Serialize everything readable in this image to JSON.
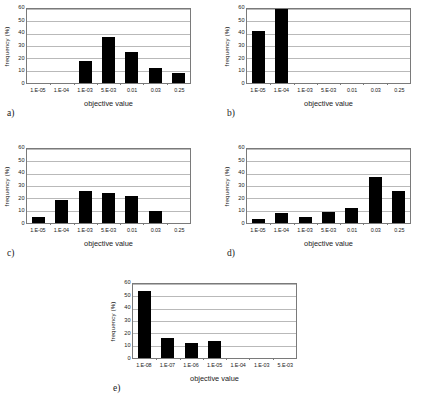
{
  "figure": {
    "background": "#ffffff",
    "bar_color": "#000000",
    "grid_color": "#b9b9b9",
    "axis_color": "#7a7a7a",
    "panel_count": 5
  },
  "common": {
    "ylabel": "frequency (%)",
    "xlabel": "objective value",
    "yticks": [
      "0",
      "10",
      "20",
      "30",
      "40",
      "50",
      "60"
    ],
    "ylim": [
      0,
      60
    ]
  },
  "panels": [
    {
      "letter": "a)",
      "key": "a"
    },
    {
      "letter": "b)",
      "key": "b"
    },
    {
      "letter": "c)",
      "key": "c"
    },
    {
      "letter": "d)",
      "key": "d"
    },
    {
      "letter": "e)",
      "key": "e"
    }
  ],
  "chart_data": [
    {
      "id": "a",
      "type": "bar",
      "title": "a)",
      "xlabel": "objective value",
      "ylabel": "frequency (%)",
      "categories": [
        "1.E-05",
        "1.E-04",
        "1.E-03",
        "5.E-03",
        "0.01",
        "0.03",
        "0.25"
      ],
      "values": [
        0,
        0,
        18,
        37,
        25,
        12,
        8
      ],
      "ylim": [
        0,
        60
      ],
      "yticks": [
        0,
        10,
        20,
        30,
        40,
        50,
        60
      ],
      "grid": true,
      "legend": "none"
    },
    {
      "id": "b",
      "type": "bar",
      "title": "b)",
      "xlabel": "objective value",
      "ylabel": "frequency (%)",
      "categories": [
        "1.E-05",
        "1.E-04",
        "1.E-03",
        "5.E-03",
        "0.01",
        "0.03",
        "0.25"
      ],
      "values": [
        42,
        60,
        0,
        0,
        0,
        0,
        0
      ],
      "ylim": [
        0,
        60
      ],
      "yticks": [
        0,
        10,
        20,
        30,
        40,
        50,
        60
      ],
      "grid": true,
      "legend": "none"
    },
    {
      "id": "c",
      "type": "bar",
      "title": "c)",
      "xlabel": "objective value",
      "ylabel": "frequency (%)",
      "categories": [
        "1.E-05",
        "1.E-04",
        "1.E-03",
        "5.E-03",
        "0.01",
        "0.03",
        "0.25"
      ],
      "values": [
        5,
        19,
        26,
        24,
        22,
        10,
        0
      ],
      "ylim": [
        0,
        60
      ],
      "yticks": [
        0,
        10,
        20,
        30,
        40,
        50,
        60
      ],
      "grid": true,
      "legend": "none"
    },
    {
      "id": "d",
      "type": "bar",
      "title": "d)",
      "xlabel": "objective value",
      "ylabel": "frequency (%)",
      "categories": [
        "1.E-05",
        "1.E-04",
        "1.E-03",
        "5.E-03",
        "0.01",
        "0.03",
        "0.25"
      ],
      "values": [
        3,
        8,
        5,
        9,
        12,
        37,
        26
      ],
      "ylim": [
        0,
        60
      ],
      "yticks": [
        0,
        10,
        20,
        30,
        40,
        50,
        60
      ],
      "grid": true,
      "legend": "none"
    },
    {
      "id": "e",
      "type": "bar",
      "title": "e)",
      "xlabel": "objective value",
      "ylabel": "frequency (%)",
      "categories": [
        "1.E-08",
        "1.E-07",
        "1.E-06",
        "1.E-05",
        "1.E-04",
        "1.E-03",
        "5.E-03"
      ],
      "values": [
        54,
        16,
        12,
        14,
        0,
        0,
        0
      ],
      "ylim": [
        0,
        60
      ],
      "yticks": [
        0,
        10,
        20,
        30,
        40,
        50,
        60
      ],
      "grid": true,
      "legend": "none"
    }
  ]
}
